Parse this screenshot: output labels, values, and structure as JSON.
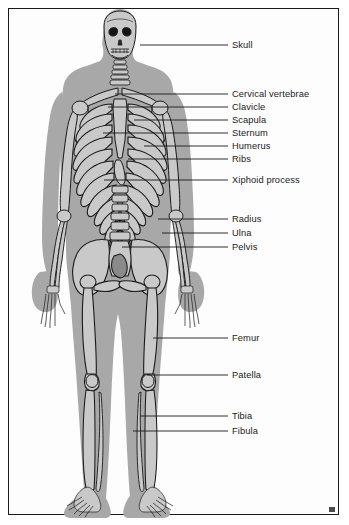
{
  "figure": {
    "view": "anterior",
    "border_color": "#1a1a1a",
    "background_color": "#fdfdfd",
    "body_silhouette_color": "#a8a8a8",
    "bone_fill_color": "#c9c9c9",
    "bone_line_color": "#1a1a1a",
    "leader_line_color": "#1a1a1a",
    "label_text_color": "#1a1a1a"
  },
  "labels": [
    {
      "id": "skull",
      "text": "Skull",
      "label_x": 232,
      "label_y": 41,
      "leader_from_x": 140,
      "leader_from_y": 45,
      "leader_to_x": 228,
      "leader_to_y": 45
    },
    {
      "id": "cervical-vertebrae",
      "text": "Cervical vertebrae",
      "label_x": 232,
      "label_y": 90,
      "leader_from_x": 115,
      "leader_from_y": 94,
      "leader_to_x": 228,
      "leader_to_y": 94
    },
    {
      "id": "clavicle",
      "text": "Clavicle",
      "label_x": 232,
      "label_y": 103,
      "leader_from_x": 108,
      "leader_from_y": 107,
      "leader_to_x": 228,
      "leader_to_y": 107
    },
    {
      "id": "scapula",
      "text": "Scapula",
      "label_x": 232,
      "label_y": 116,
      "leader_from_x": 134,
      "leader_from_y": 120,
      "leader_to_x": 228,
      "leader_to_y": 120
    },
    {
      "id": "sternum",
      "text": "Sternum",
      "label_x": 232,
      "label_y": 129,
      "leader_from_x": 103,
      "leader_from_y": 133,
      "leader_to_x": 228,
      "leader_to_y": 133
    },
    {
      "id": "humerus",
      "text": "Humerus",
      "label_x": 232,
      "label_y": 142,
      "leader_from_x": 144,
      "leader_from_y": 146,
      "leader_to_x": 228,
      "leader_to_y": 146
    },
    {
      "id": "ribs",
      "text": "Ribs",
      "label_x": 232,
      "label_y": 155,
      "leader_from_x": 128,
      "leader_from_y": 159,
      "leader_to_x": 228,
      "leader_to_y": 159
    },
    {
      "id": "xiphoid-process",
      "text": "Xiphoid process",
      "label_x": 232,
      "label_y": 176,
      "leader_from_x": 104,
      "leader_from_y": 180,
      "leader_to_x": 228,
      "leader_to_y": 180
    },
    {
      "id": "radius",
      "text": "Radius",
      "label_x": 232,
      "label_y": 215,
      "leader_from_x": 158,
      "leader_from_y": 219,
      "leader_to_x": 228,
      "leader_to_y": 219
    },
    {
      "id": "ulna",
      "text": "Ulna",
      "label_x": 232,
      "label_y": 229,
      "leader_from_x": 162,
      "leader_from_y": 233,
      "leader_to_x": 228,
      "leader_to_y": 233
    },
    {
      "id": "pelvis",
      "text": "Pelvis",
      "label_x": 232,
      "label_y": 243,
      "leader_from_x": 122,
      "leader_from_y": 247,
      "leader_to_x": 228,
      "leader_to_y": 247
    },
    {
      "id": "femur",
      "text": "Femur",
      "label_x": 232,
      "label_y": 334,
      "leader_from_x": 153,
      "leader_from_y": 338,
      "leader_to_x": 228,
      "leader_to_y": 338
    },
    {
      "id": "patella",
      "text": "Patella",
      "label_x": 232,
      "label_y": 371,
      "leader_from_x": 147,
      "leader_from_y": 375,
      "leader_to_x": 228,
      "leader_to_y": 375
    },
    {
      "id": "tibia",
      "text": "Tibia",
      "label_x": 232,
      "label_y": 412,
      "leader_from_x": 140,
      "leader_from_y": 416,
      "leader_to_x": 228,
      "leader_to_y": 416
    },
    {
      "id": "fibula",
      "text": "Fibula",
      "label_x": 232,
      "label_y": 427,
      "leader_from_x": 133,
      "leader_from_y": 431,
      "leader_to_x": 228,
      "leader_to_y": 431
    }
  ],
  "skeleton_parts": [
    "cranium",
    "mandible",
    "cervical-vertebrae",
    "clavicle",
    "scapula",
    "sternum",
    "ribs",
    "xiphoid-process",
    "thoracic-spine",
    "lumbar-spine",
    "humerus",
    "radius",
    "ulna",
    "carpals",
    "metacarpals",
    "phalanges-hand",
    "pelvis",
    "sacrum",
    "femur",
    "patella",
    "tibia",
    "fibula",
    "tarsals",
    "metatarsals",
    "phalanges-foot"
  ],
  "counts": {
    "rib_pairs": 12
  }
}
